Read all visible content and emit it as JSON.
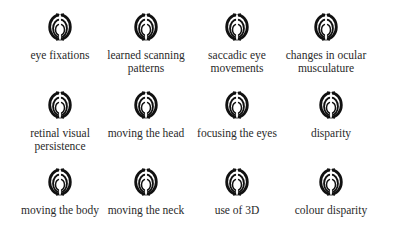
{
  "items": [
    {
      "label": "eye fixations",
      "icon": "concentric-arc-icon"
    },
    {
      "label": "learned scanning patterns",
      "icon": "concentric-arc-icon"
    },
    {
      "label": "saccadic eye movements",
      "icon": "concentric-arc-icon"
    },
    {
      "label": "changes in ocular musculature",
      "icon": "concentric-arc-icon"
    },
    {
      "label": "retinal visual persistence",
      "icon": "concentric-arc-icon"
    },
    {
      "label": "moving the head",
      "icon": "concentric-arc-icon"
    },
    {
      "label": "focusing the eyes",
      "icon": "concentric-arc-icon"
    },
    {
      "label": "disparity",
      "icon": "concentric-arc-icon"
    },
    {
      "label": "moving the body",
      "icon": "concentric-arc-icon"
    },
    {
      "label": "moving the neck",
      "icon": "concentric-arc-icon"
    },
    {
      "label": "use of 3D",
      "icon": "concentric-arc-icon"
    },
    {
      "label": "colour disparity",
      "icon": "concentric-arc-icon"
    }
  ]
}
